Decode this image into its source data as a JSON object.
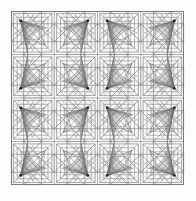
{
  "artwork": {
    "title": "Symmetric Geometric Line Pattern",
    "type": "line-art-tiling",
    "canvas": {
      "width": 196,
      "height": 201
    },
    "background_color": "#fdfdfd",
    "paper_color": "#fbfbfb",
    "frame": {
      "x": 11,
      "y": 11,
      "width": 173,
      "height": 174,
      "stroke_color": "#6e6e6e",
      "stroke_width": 0.9,
      "fill_color": "#fcfcfc"
    },
    "grid": {
      "columns": 4,
      "rows": 4,
      "cell_width": 43.25,
      "cell_height": 43.5,
      "line_color": "#7b7b7b",
      "line_width": 0.6,
      "mirror_alternating": true
    },
    "palette": {
      "line_dark": "#4a4a4a",
      "line_mid": "#6b6b6b",
      "line_light": "#8d8d8d",
      "line_faint": "#b4b4b4",
      "node": "#2e2e2e",
      "accent": "#555555"
    },
    "motif": {
      "name": "fan-and-star-tile",
      "node": {
        "cx": 0.225,
        "cy": 0.225,
        "r": 1.55,
        "color": "#2e2e2e"
      },
      "nested_squares": [
        {
          "inset": 0.055,
          "color": "#6b6b6b",
          "width": 0.6
        },
        {
          "inset": 0.145,
          "color": "#7a7a7a",
          "width": 0.55
        },
        {
          "inset": 0.235,
          "color": "#8d8d8d",
          "width": 0.5
        },
        {
          "inset": 0.345,
          "color": "#9b9b9b",
          "width": 0.45
        }
      ],
      "fan": {
        "rays": 26,
        "origin": {
          "x": 0.225,
          "y": 0.225
        },
        "arc_center": {
          "x": 0.9,
          "y": 0.9
        },
        "arc_radius": 0.52,
        "start_angle_deg": 168,
        "end_angle_deg": 262,
        "color": "#6f6f6f",
        "width": 0.38
      },
      "star_polygon": {
        "points": 8,
        "center": {
          "x": 0.5,
          "y": 0.5
        },
        "radius": 0.54,
        "skip": 3,
        "rotation_deg": 22.5,
        "color": "#5f5f5f",
        "width": 0.5
      },
      "corner_chords": {
        "count": 7,
        "color": "#8a8a8a",
        "width": 0.4
      },
      "diagonals": {
        "color": "#6b6b6b",
        "width": 0.5
      }
    }
  },
  "meta": {
    "shape_count_label": "",
    "caption": ""
  }
}
